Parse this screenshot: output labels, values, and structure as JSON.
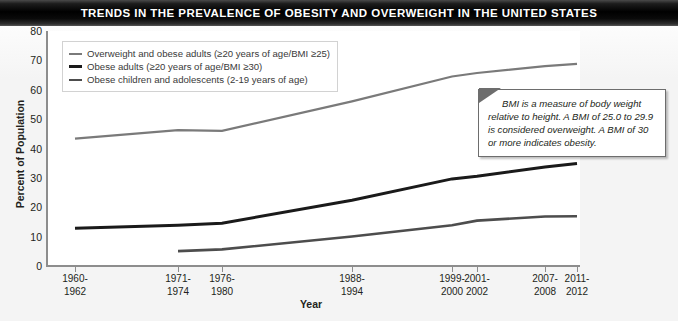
{
  "title": "TRENDS IN THE PREVALENCE OF OBESITY AND OVERWEIGHT IN THE UNITED STATES",
  "annotation": {
    "text": "BMI is a measure of body weight relative to height.  A BMI of 25.0 to 29.9 is considered overweight.  A BMI of 30 or more indicates obesity."
  },
  "chart_data": {
    "type": "line",
    "title": "TRENDS IN THE PREVALENCE OF OBESITY AND OVERWEIGHT IN THE UNITED STATES",
    "xlabel": "Year",
    "ylabel": "Percent of Population",
    "ylim": [
      0,
      80
    ],
    "yticks": [
      0,
      10,
      20,
      30,
      40,
      50,
      60,
      70,
      80
    ],
    "grid": false,
    "legend_position": "top-left",
    "categories": [
      "1960-1962",
      "1971-1974",
      "1976-1980",
      "1988-1994",
      "1999-2000",
      "2001-2002",
      "2007-2008",
      "2011-2012"
    ],
    "category_lines": [
      [
        "1960-",
        "1962"
      ],
      [
        "1971-",
        "1974"
      ],
      [
        "1976-",
        "1980"
      ],
      [
        "1988-",
        "1994"
      ],
      [
        "1999-",
        "2000"
      ],
      [
        "2001-",
        "2002"
      ],
      [
        "2007-",
        "2008"
      ],
      [
        "2011-",
        "2012"
      ]
    ],
    "series": [
      {
        "name": "Overweight and obese adults (≥20 years of age/BMI ≥25)",
        "color": "#7a7a7a",
        "values": [
          43.3,
          46.2,
          46.0,
          56.0,
          64.5,
          65.7,
          68.0,
          68.8
        ]
      },
      {
        "name": "Obese adults (≥20 years of age/BMI ≥30)",
        "color": "#1a1a1a",
        "values": [
          12.8,
          13.8,
          14.5,
          22.3,
          29.6,
          30.5,
          33.7,
          34.9
        ]
      },
      {
        "name": "Obese children and adolescents (2-19 years of age)",
        "color": "#4d4d4d",
        "values": [
          null,
          5.0,
          5.6,
          10.0,
          13.8,
          15.4,
          16.8,
          16.9
        ]
      }
    ]
  },
  "legend": [
    {
      "label": "Overweight and obese adults (≥20 years of age/BMI ≥25)",
      "color": "#7a7a7a",
      "width": 2.2
    },
    {
      "label": "Obese adults (≥20 years of age/BMI ≥30)",
      "color": "#1a1a1a",
      "width": 3
    },
    {
      "label": "Obese children and adolescents (2-19 years of age)",
      "color": "#4d4d4d",
      "width": 2.6
    }
  ]
}
